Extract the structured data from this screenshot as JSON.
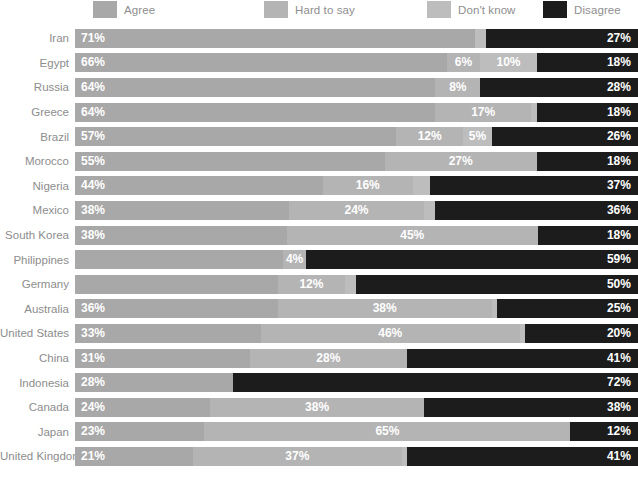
{
  "legend": {
    "items": [
      {
        "label": "Agree",
        "color": "#a8a8a8",
        "key": "agree",
        "x": 93
      },
      {
        "label": "Hard to say",
        "color": "#b4b4b4",
        "key": "hard_to_say",
        "x": 264
      },
      {
        "label": "Don't know",
        "color": "#bdbdbd",
        "key": "dont_know",
        "x": 427
      },
      {
        "label": "Disagree",
        "color": "#1c1c1c",
        "key": "disagree",
        "x": 543
      }
    ]
  },
  "chart_data": {
    "type": "bar",
    "subtype": "stacked-horizontal-100pct",
    "title": "",
    "xlabel": "",
    "ylabel": "",
    "xlim": [
      0,
      100
    ],
    "grid": false,
    "legend_position": "top",
    "series": [
      {
        "name": "Agree",
        "key": "agree",
        "color": "#a8a8a8"
      },
      {
        "name": "Hard to say",
        "key": "hard_to_say",
        "color": "#b4b4b4"
      },
      {
        "name": "Don't know",
        "key": "dont_know",
        "color": "#bdbdbd"
      },
      {
        "name": "Disagree",
        "key": "disagree",
        "color": "#1c1c1c"
      }
    ],
    "categories": [
      "Iran",
      "Egypt",
      "Russia",
      "Greece",
      "Brazil",
      "Morocco",
      "Nigeria",
      "Mexico",
      "South Korea",
      "Philippines",
      "Germany",
      "Australia",
      "United States",
      "China",
      "Indonesia",
      "Canada",
      "Japan",
      "United Kingdom"
    ],
    "rows": [
      {
        "category": "Iran",
        "lead_value": "71%",
        "segments": [
          {
            "key": "agree",
            "value": 71,
            "label": "71%",
            "show": true
          },
          {
            "key": "hard_to_say",
            "value": 0,
            "label": "",
            "show": false
          },
          {
            "key": "dont_know",
            "value": 2,
            "label": "2%",
            "show": false
          },
          {
            "key": "disagree",
            "value": 27,
            "label": "27%",
            "show": true
          }
        ]
      },
      {
        "category": "Egypt",
        "lead_value": "66%",
        "segments": [
          {
            "key": "agree",
            "value": 66,
            "label": "66%",
            "show": true
          },
          {
            "key": "hard_to_say",
            "value": 6,
            "label": "6%",
            "show": true
          },
          {
            "key": "dont_know",
            "value": 10,
            "label": "10%",
            "show": true
          },
          {
            "key": "disagree",
            "value": 18,
            "label": "18%",
            "show": true
          }
        ]
      },
      {
        "category": "Russia",
        "lead_value": "64%",
        "segments": [
          {
            "key": "agree",
            "value": 64,
            "label": "64%",
            "show": true
          },
          {
            "key": "hard_to_say",
            "value": 8,
            "label": "8%",
            "show": true
          },
          {
            "key": "dont_know",
            "value": 0,
            "label": "",
            "show": false
          },
          {
            "key": "disagree",
            "value": 28,
            "label": "28%",
            "show": true
          }
        ]
      },
      {
        "category": "Greece",
        "lead_value": "64%",
        "segments": [
          {
            "key": "agree",
            "value": 64,
            "label": "64%",
            "show": true
          },
          {
            "key": "hard_to_say",
            "value": 17,
            "label": "17%",
            "show": true
          },
          {
            "key": "dont_know",
            "value": 1,
            "label": "",
            "show": false
          },
          {
            "key": "disagree",
            "value": 18,
            "label": "18%",
            "show": true
          }
        ]
      },
      {
        "category": "Brazil",
        "lead_value": "57%",
        "segments": [
          {
            "key": "agree",
            "value": 57,
            "label": "57%",
            "show": true
          },
          {
            "key": "hard_to_say",
            "value": 12,
            "label": "12%",
            "show": true
          },
          {
            "key": "dont_know",
            "value": 5,
            "label": "5%",
            "show": true
          },
          {
            "key": "disagree",
            "value": 26,
            "label": "26%",
            "show": true
          }
        ]
      },
      {
        "category": "Morocco",
        "lead_value": "55%",
        "segments": [
          {
            "key": "agree",
            "value": 55,
            "label": "55%",
            "show": true
          },
          {
            "key": "hard_to_say",
            "value": 27,
            "label": "27%",
            "show": true
          },
          {
            "key": "dont_know",
            "value": 0,
            "label": "",
            "show": false
          },
          {
            "key": "disagree",
            "value": 18,
            "label": "18%",
            "show": true
          }
        ]
      },
      {
        "category": "Nigeria",
        "lead_value": "44%",
        "segments": [
          {
            "key": "agree",
            "value": 44,
            "label": "44%",
            "show": true
          },
          {
            "key": "hard_to_say",
            "value": 16,
            "label": "16%",
            "show": true
          },
          {
            "key": "dont_know",
            "value": 3,
            "label": "",
            "show": false
          },
          {
            "key": "disagree",
            "value": 37,
            "label": "37%",
            "show": true
          }
        ]
      },
      {
        "category": "Mexico",
        "lead_value": "38%",
        "segments": [
          {
            "key": "agree",
            "value": 38,
            "label": "38%",
            "show": true
          },
          {
            "key": "hard_to_say",
            "value": 24,
            "label": "24%",
            "show": true
          },
          {
            "key": "dont_know",
            "value": 2,
            "label": "",
            "show": false
          },
          {
            "key": "disagree",
            "value": 36,
            "label": "36%",
            "show": true
          }
        ]
      },
      {
        "category": "South Korea",
        "lead_value": "38%",
        "segments": [
          {
            "key": "agree",
            "value": 38,
            "label": "38%",
            "show": true
          },
          {
            "key": "hard_to_say",
            "value": 45,
            "label": "45%",
            "show": true
          },
          {
            "key": "dont_know",
            "value": 0,
            "label": "",
            "show": false
          },
          {
            "key": "disagree",
            "value": 18,
            "label": "18%",
            "show": true
          }
        ]
      },
      {
        "category": "Philippines",
        "lead_value": "37%",
        "segments": [
          {
            "key": "agree",
            "value": 37,
            "label": "37%",
            "show": false
          },
          {
            "key": "hard_to_say",
            "value": 4,
            "label": "4%",
            "show": true
          },
          {
            "key": "dont_know",
            "value": 0,
            "label": "",
            "show": false
          },
          {
            "key": "disagree",
            "value": 59,
            "label": "59%",
            "show": true
          }
        ]
      },
      {
        "category": "Germany",
        "lead_value": "36%",
        "segments": [
          {
            "key": "agree",
            "value": 36,
            "label": "36%",
            "show": false
          },
          {
            "key": "hard_to_say",
            "value": 12,
            "label": "12%",
            "show": true
          },
          {
            "key": "dont_know",
            "value": 2,
            "label": "",
            "show": false
          },
          {
            "key": "disagree",
            "value": 50,
            "label": "50%",
            "show": true
          }
        ]
      },
      {
        "category": "Australia",
        "lead_value": "36%",
        "segments": [
          {
            "key": "agree",
            "value": 36,
            "label": "36%",
            "show": true
          },
          {
            "key": "hard_to_say",
            "value": 38,
            "label": "38%",
            "show": true
          },
          {
            "key": "dont_know",
            "value": 1,
            "label": "",
            "show": false
          },
          {
            "key": "disagree",
            "value": 25,
            "label": "25%",
            "show": true
          }
        ]
      },
      {
        "category": "United States",
        "lead_value": "33%",
        "segments": [
          {
            "key": "agree",
            "value": 33,
            "label": "33%",
            "show": true
          },
          {
            "key": "hard_to_say",
            "value": 46,
            "label": "46%",
            "show": true
          },
          {
            "key": "dont_know",
            "value": 1,
            "label": "",
            "show": false
          },
          {
            "key": "disagree",
            "value": 20,
            "label": "20%",
            "show": true
          }
        ]
      },
      {
        "category": "China",
        "lead_value": "31%",
        "segments": [
          {
            "key": "agree",
            "value": 31,
            "label": "31%",
            "show": true
          },
          {
            "key": "hard_to_say",
            "value": 28,
            "label": "28%",
            "show": true
          },
          {
            "key": "dont_know",
            "value": 0,
            "label": "",
            "show": false
          },
          {
            "key": "disagree",
            "value": 41,
            "label": "41%",
            "show": true
          }
        ]
      },
      {
        "category": "Indonesia",
        "lead_value": "28%",
        "segments": [
          {
            "key": "agree",
            "value": 28,
            "label": "28%",
            "show": true
          },
          {
            "key": "hard_to_say",
            "value": 0,
            "label": "",
            "show": false
          },
          {
            "key": "dont_know",
            "value": 0,
            "label": "",
            "show": false
          },
          {
            "key": "disagree",
            "value": 72,
            "label": "72%",
            "show": true
          }
        ]
      },
      {
        "category": "Canada",
        "lead_value": "24%",
        "segments": [
          {
            "key": "agree",
            "value": 24,
            "label": "24%",
            "show": true
          },
          {
            "key": "hard_to_say",
            "value": 38,
            "label": "38%",
            "show": true
          },
          {
            "key": "dont_know",
            "value": 0,
            "label": "",
            "show": false
          },
          {
            "key": "disagree",
            "value": 38,
            "label": "38%",
            "show": true
          }
        ]
      },
      {
        "category": "Japan",
        "lead_value": "23%",
        "segments": [
          {
            "key": "agree",
            "value": 23,
            "label": "23%",
            "show": true
          },
          {
            "key": "hard_to_say",
            "value": 65,
            "label": "65%",
            "show": true
          },
          {
            "key": "dont_know",
            "value": 0,
            "label": "",
            "show": false
          },
          {
            "key": "disagree",
            "value": 12,
            "label": "12%",
            "show": true
          }
        ]
      },
      {
        "category": "United Kingdom",
        "lead_value": "21%",
        "segments": [
          {
            "key": "agree",
            "value": 21,
            "label": "21%",
            "show": true
          },
          {
            "key": "hard_to_say",
            "value": 37,
            "label": "37%",
            "show": true
          },
          {
            "key": "dont_know",
            "value": 1,
            "label": "",
            "show": false
          },
          {
            "key": "disagree",
            "value": 41,
            "label": "41%",
            "show": true
          }
        ]
      }
    ]
  }
}
